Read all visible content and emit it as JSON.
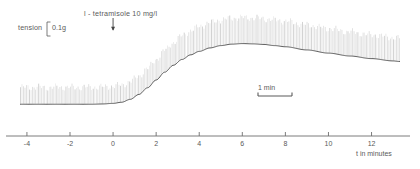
{
  "figure": {
    "annotations": {
      "tension_label": "tension",
      "tension_value": "0.1g",
      "drug_label": "l - tetramisole   10 mg/l",
      "scalebar_label": "1 min",
      "axis_caption": "t in minutes"
    },
    "colors": {
      "trace": "#4f4f4f",
      "hatch": "#b9b9b9",
      "axis": "#6e6e6e",
      "text": "#5a5a5a"
    }
  },
  "chart_data": {
    "type": "line",
    "title": "",
    "xlabel": "t in minutes",
    "ylabel": "tension",
    "xlim": [
      -4.6,
      13.6
    ],
    "ylim": [
      0,
      0.27
    ],
    "grid": false,
    "legend": null,
    "y_scale_bar": {
      "value": 0.1,
      "unit": "g",
      "label": "0.1g"
    },
    "x_scale_bar": {
      "value": 1,
      "unit": "min",
      "label": "1 min"
    },
    "xticks": [
      -4,
      -2,
      0,
      2,
      4,
      6,
      8,
      10,
      12
    ],
    "xticklabels": [
      "-4",
      "-2",
      "0",
      "2",
      "4",
      "6",
      "8",
      "10",
      "12"
    ],
    "annotations": [
      {
        "text": "l - tetramisole   10 mg/l",
        "x": 0,
        "marker": "down-arrow",
        "note": "drug applied at t = 0"
      }
    ],
    "series": [
      {
        "name": "tension",
        "note": "smooth muscle contraction trace; striated band above curve is pen oscillation envelope",
        "x": [
          -4.3,
          -3.5,
          -3.0,
          -2.5,
          -2.0,
          -1.5,
          -1.0,
          -0.5,
          0.0,
          0.4,
          0.8,
          1.2,
          1.6,
          2.0,
          2.4,
          2.8,
          3.2,
          3.6,
          4.0,
          4.5,
          5.0,
          5.5,
          6.0,
          6.5,
          7.0,
          7.5,
          8.0,
          9.0,
          10.0,
          11.0,
          12.0,
          13.0,
          13.3
        ],
        "y": [
          0.013,
          0.013,
          0.013,
          0.013,
          0.013,
          0.013,
          0.013,
          0.014,
          0.016,
          0.02,
          0.03,
          0.047,
          0.07,
          0.097,
          0.124,
          0.148,
          0.168,
          0.184,
          0.196,
          0.208,
          0.216,
          0.221,
          0.223,
          0.222,
          0.22,
          0.216,
          0.212,
          0.201,
          0.19,
          0.18,
          0.171,
          0.163,
          0.161
        ]
      }
    ]
  }
}
